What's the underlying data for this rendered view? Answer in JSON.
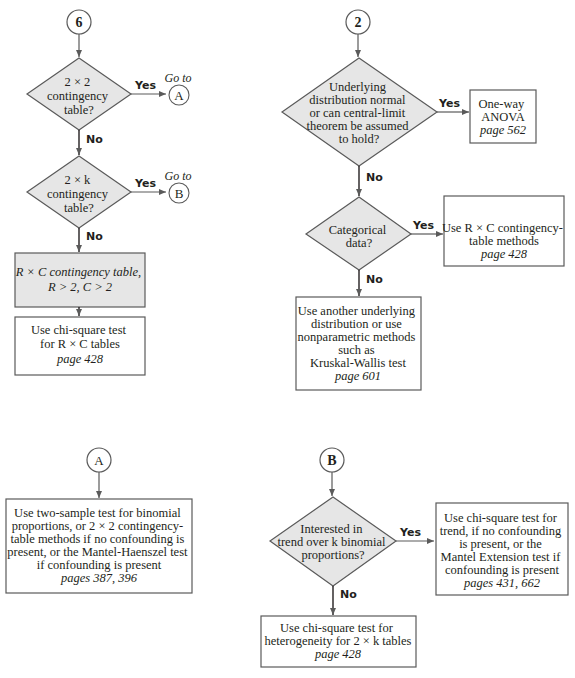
{
  "colors": {
    "shape_fill": "#e6e6e6",
    "stroke": "#5a5a5a",
    "box_fill": "#ffffff",
    "text": "#231f20"
  },
  "connectors": {
    "c6": "6",
    "c2": "2",
    "cA": "A",
    "cB": "B",
    "goto": "Go to"
  },
  "labels": {
    "yes": "Yes",
    "no": "No"
  },
  "flow6": {
    "d1": [
      "2 × 2",
      "contingency",
      "table?"
    ],
    "d2": [
      "2 × k",
      "contingency",
      "table?"
    ],
    "rc_box": [
      "R × C contingency table,",
      "R > 2, C > 2"
    ],
    "chi_box": [
      "Use chi-square test",
      "for R × C tables"
    ],
    "chi_page": "page 428"
  },
  "flow2": {
    "d1": [
      "Underlying",
      "distribution normal",
      "or can central-limit",
      "theorem be assumed",
      "to hold?"
    ],
    "anova_box": [
      "One-way",
      "ANOVA"
    ],
    "anova_page": "page 562",
    "d2": [
      "Categorical",
      "data?"
    ],
    "rc_box": [
      "Use R × C contingency-",
      "table methods"
    ],
    "rc_page": "page 428",
    "other_box": [
      "Use another underlying",
      "distribution or use",
      "nonparametric methods",
      "such as",
      "Kruskal-Wallis test"
    ],
    "other_page": "page 601"
  },
  "flowA": {
    "box": [
      "Use two-sample test for binomial",
      "proportions, or 2 × 2 contingency-",
      "table methods if no confounding is",
      "present, or the Mantel-Haenszel test",
      "if confounding is present"
    ],
    "page": "pages 387, 396"
  },
  "flowB": {
    "d1": [
      "Interested in",
      "trend over k binomial",
      "proportions?"
    ],
    "trend_box": [
      "Use chi-square test for",
      "trend, if no confounding",
      "is present, or the",
      "Mantel Extension test if",
      "confounding is present"
    ],
    "trend_page": "pages 431, 662",
    "het_box": [
      "Use chi-square test for",
      "heterogeneity for 2 × k tables"
    ],
    "het_page": "page 428"
  }
}
